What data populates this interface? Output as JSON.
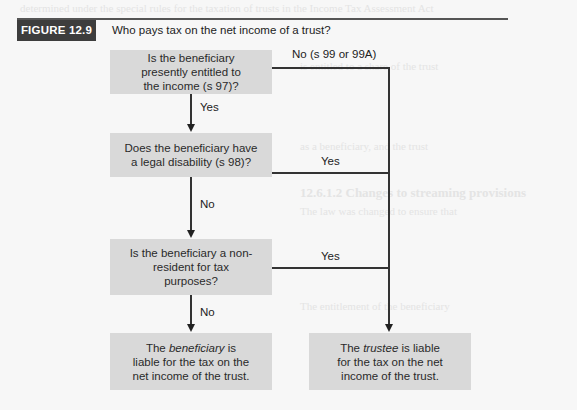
{
  "figure": {
    "label": "FIGURE 12.9",
    "title": "Who pays tax on the net income of a trust?"
  },
  "colors": {
    "label_bg": "#3d3d3d",
    "box_bg": "#d9d9d9",
    "line": "#333333"
  },
  "nodes": {
    "q1": "Is the beneficiary presently entitled to the income (s 97)?",
    "q2": "Does the beneficiary have a legal disability (s 98)?",
    "q3": "Is the beneficiary a non-resident for tax purposes?",
    "r_beneficiary": {
      "pre": "The ",
      "em": "beneficiary",
      "post": " is liable for the tax on the net income of the trust."
    },
    "r_trustee": {
      "pre": "The ",
      "em": "trustee",
      "post": " is liable for the tax on the net income of the trust."
    }
  },
  "edges": {
    "q1_no": "No (s 99 or 99A)",
    "q1_yes": "Yes",
    "q2_yes": "Yes",
    "q2_no": "No",
    "q3_yes": "Yes",
    "q3_no": "No"
  }
}
